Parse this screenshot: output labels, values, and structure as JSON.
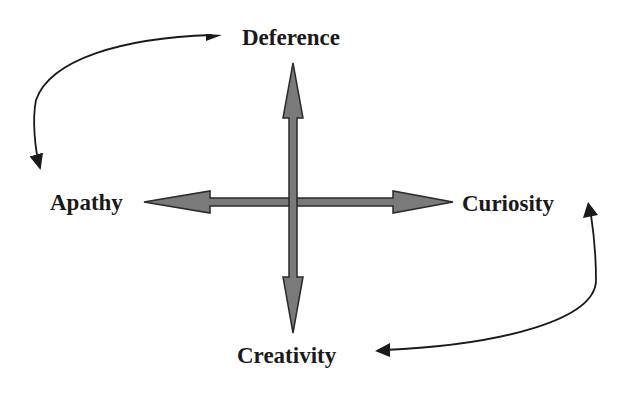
{
  "diagram": {
    "type": "quadrant-cross",
    "nodes": {
      "top": "Deference",
      "left": "Apathy",
      "right": "Curiosity",
      "bottom": "Creativity"
    },
    "axes": [
      {
        "from": "Apathy",
        "to": "Curiosity",
        "style": "double-headed block arrow",
        "orientation": "horizontal"
      },
      {
        "from": "Deference",
        "to": "Creativity",
        "style": "double-headed block arrow",
        "orientation": "vertical"
      }
    ],
    "curved_connectors": [
      {
        "between": [
          "Deference",
          "Apathy"
        ],
        "style": "double-headed curved arrow",
        "position": "top-left"
      },
      {
        "between": [
          "Curiosity",
          "Creativity"
        ],
        "style": "double-headed curved arrow",
        "position": "bottom-right"
      }
    ],
    "colors": {
      "arrow_fill": "#7a7a7a",
      "arrow_stroke": "#2a2a2a",
      "text": "#1a1a1a",
      "background": "#ffffff"
    }
  }
}
